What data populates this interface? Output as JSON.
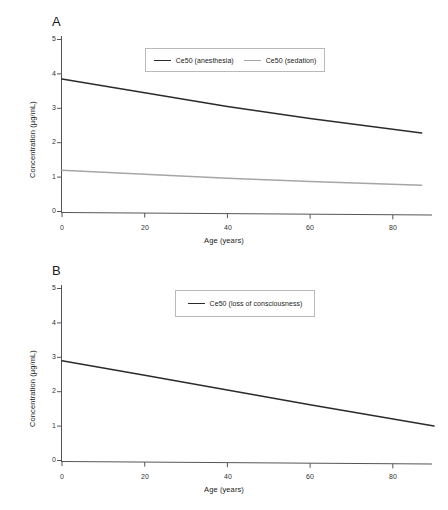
{
  "figure": {
    "background": "#ffffff",
    "panels": [
      {
        "id": "A",
        "label": "A"
      },
      {
        "id": "B",
        "label": "B"
      }
    ]
  },
  "colors": {
    "anesthesia_line": "#2b2b2b",
    "sedation_line": "#a6a6a6",
    "loc_line": "#2b2b2b",
    "axis": "#555555",
    "legend_border": "#b9b9b9",
    "text": "#222222"
  },
  "panel_a": {
    "label": "A",
    "legend": [
      {
        "name": "Ce50 (anesthesia)",
        "color": "#2b2b2b"
      },
      {
        "name": "Ce50 (sedation)",
        "color": "#a6a6a6"
      }
    ],
    "y_ticks": [
      "0",
      "1",
      "2",
      "3",
      "4",
      "5"
    ],
    "x_ticks": [
      "0",
      "20",
      "40",
      "60",
      "80"
    ],
    "xlabel": "Age (years)",
    "ylabel": "Concentration (µg/mL)"
  },
  "panel_b": {
    "label": "B",
    "legend": [
      {
        "name": "Ce50 (loss of consciousness)",
        "color": "#2b2b2b"
      }
    ],
    "y_ticks": [
      "0",
      "1",
      "2",
      "3",
      "4",
      "5"
    ],
    "x_ticks": [
      "0",
      "20",
      "40",
      "60",
      "80"
    ],
    "xlabel": "Age (years)",
    "ylabel": "Concentration (µg/mL)"
  },
  "chart_data": [
    {
      "type": "line",
      "panel": "A",
      "title": "A",
      "xlabel": "Age (years)",
      "ylabel": "Concentration (µg/mL)",
      "xlim": [
        0,
        90
      ],
      "ylim": [
        0,
        5.2
      ],
      "xticks": [
        0,
        20,
        40,
        60,
        80
      ],
      "yticks": [
        0,
        1,
        2,
        3,
        4,
        5
      ],
      "grid": false,
      "legend_position": "upper center",
      "series": [
        {
          "name": "Ce50 (anesthesia)",
          "color": "#2b2b2b",
          "x": [
            0,
            20,
            40,
            60,
            87
          ],
          "values": [
            3.85,
            3.45,
            3.05,
            2.7,
            2.28
          ]
        },
        {
          "name": "Ce50 (sedation)",
          "color": "#a6a6a6",
          "x": [
            0,
            20,
            40,
            60,
            87
          ],
          "values": [
            1.2,
            1.08,
            0.97,
            0.87,
            0.76
          ]
        }
      ]
    },
    {
      "type": "line",
      "panel": "B",
      "title": "B",
      "xlabel": "Age (years)",
      "ylabel": "Concentration (µg/mL)",
      "xlim": [
        0,
        90
      ],
      "ylim": [
        0,
        5.2
      ],
      "xticks": [
        0,
        20,
        40,
        60,
        80
      ],
      "yticks": [
        0,
        1,
        2,
        3,
        4,
        5
      ],
      "grid": false,
      "legend_position": "upper center",
      "series": [
        {
          "name": "Ce50 (loss of consciousness)",
          "color": "#2b2b2b",
          "x": [
            0,
            20,
            40,
            60,
            90
          ],
          "values": [
            2.9,
            2.48,
            2.05,
            1.62,
            1.0
          ]
        }
      ]
    }
  ]
}
